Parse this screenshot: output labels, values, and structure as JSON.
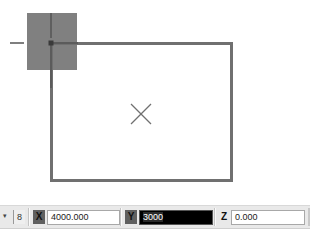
{
  "canvas": {
    "rectangle": {
      "x": 51,
      "y": 43,
      "width": 181,
      "height": 138,
      "stroke": "#707070",
      "stroke_width": 3
    },
    "grip_square": {
      "x": 27,
      "y": 13,
      "width": 50,
      "height": 57,
      "fill": "#808080"
    },
    "cursor_crosshair": {
      "x": 51,
      "y": 43
    },
    "center_marker": {
      "x": 141,
      "y": 114,
      "size": 10,
      "stroke": "#707070"
    }
  },
  "toolbar": {
    "overflow_arrow": "▾",
    "snap_button_label": "8",
    "x": {
      "label": "X",
      "value": "4000.000"
    },
    "y": {
      "label": "Y",
      "value": "3000"
    },
    "z": {
      "label": "Z",
      "value": "0.000"
    }
  },
  "colors": {
    "toolbar_bg": "#e9e9e9",
    "active_field_bg": "#000000",
    "axis_label_bg": "#606060"
  }
}
